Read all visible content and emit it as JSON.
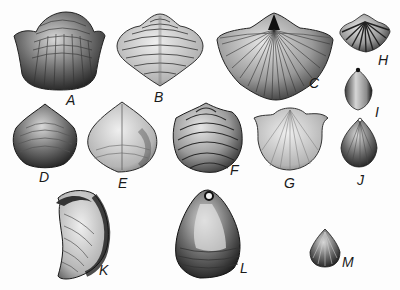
{
  "plate": {
    "description": "Plate of engraved brachiopod shell illustrations labeled A through M",
    "specimens": [
      {
        "id": "A",
        "label": "A"
      },
      {
        "id": "B",
        "label": "B"
      },
      {
        "id": "C",
        "label": "C"
      },
      {
        "id": "D",
        "label": "D"
      },
      {
        "id": "E",
        "label": "E"
      },
      {
        "id": "F",
        "label": "F"
      },
      {
        "id": "G",
        "label": "G"
      },
      {
        "id": "H",
        "label": "H"
      },
      {
        "id": "I",
        "label": "I"
      },
      {
        "id": "J",
        "label": "J"
      },
      {
        "id": "K",
        "label": "K"
      },
      {
        "id": "L",
        "label": "L"
      },
      {
        "id": "M",
        "label": "M"
      }
    ]
  },
  "colors": {
    "background": "#fdfdfd",
    "ink": "#1a1a1a",
    "shell_mid": "#8a8a8a",
    "shell_light": "#d8d8d8",
    "shell_dark": "#2e2e2e"
  }
}
